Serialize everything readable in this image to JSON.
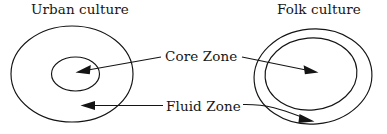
{
  "diagram": {
    "title_left": "Urban culture",
    "title_right": "Folk culture",
    "zone_core_label": "Core Zone",
    "zone_fluid_label": "Fluid Zone",
    "stroke_color": "#141414",
    "background_color": "#ffffff",
    "text_color": "#161616",
    "left_group": {
      "name": "Urban culture",
      "outer_ellipse": {
        "cx": 72,
        "cy": 74,
        "rx": 61,
        "ry": 48,
        "rotation": 0
      },
      "inner_ellipse": {
        "cx": 75.5,
        "cy": 74,
        "rx": 24,
        "ry": 17,
        "rotation": 0
      },
      "core_zone_is": "inner small ellipse",
      "fluid_zone_is": "annulus between inner and outer ellipse"
    },
    "right_group": {
      "name": "Folk culture",
      "outer_ellipse": {
        "cx": 313,
        "cy": 76.5,
        "rx": 59,
        "ry": 47.5,
        "rotation": -5
      },
      "inner_ellipse": {
        "cx": 311,
        "cy": 74,
        "rx": 46,
        "ry": 36,
        "rotation": -5
      },
      "core_zone_is": "inner large ellipse",
      "fluid_zone_is": "thin annulus between inner and outer ellipse"
    },
    "arrows": [
      {
        "label": "Core Zone",
        "target": "urban inner ellipse",
        "direction": "left",
        "tip_x": 75,
        "tip_y": 72
      },
      {
        "label": "Core Zone",
        "target": "folk inner ellipse",
        "direction": "right",
        "tip_x": 318,
        "tip_y": 73
      },
      {
        "label": "Fluid Zone",
        "target": "urban annulus",
        "direction": "left",
        "tip_x": 80,
        "tip_y": 105
      },
      {
        "label": "Fluid Zone",
        "target": "folk annulus",
        "direction": "right",
        "tip_x": 314,
        "tip_y": 118
      }
    ]
  }
}
